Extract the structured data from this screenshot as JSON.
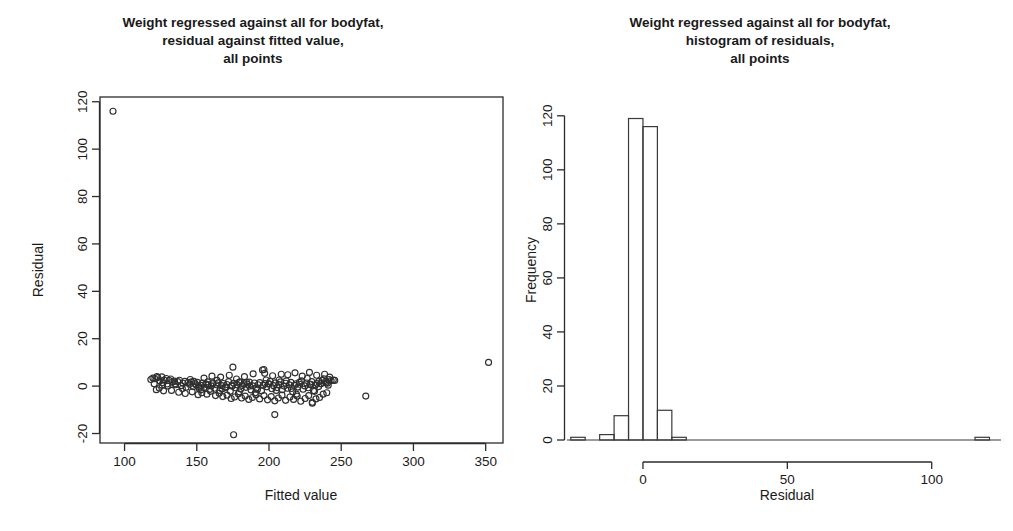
{
  "figure": {
    "background_color": "#ffffff",
    "foreground_color": "#1a1a1a",
    "panel_count": 2
  },
  "panels": [
    {
      "id": "residual-vs-fitted",
      "title_lines": [
        "Weight regressed against all for bodyfat,",
        "residual against fitted value,",
        "all points"
      ]
    },
    {
      "id": "histogram-of-residuals",
      "title_lines": [
        "Weight regressed against all for bodyfat,",
        "histogram of residuals,",
        "all points"
      ]
    }
  ],
  "chart_data": [
    {
      "type": "scatter",
      "id": "residual-vs-fitted",
      "title": "Weight regressed against all for bodyfat, residual against fitted value, all points",
      "xlabel": "Fitted value",
      "ylabel": "Residual",
      "xlim": [
        83,
        362
      ],
      "ylim": [
        -24,
        122
      ],
      "xticks": [
        100,
        150,
        200,
        250,
        300,
        350
      ],
      "yticks": [
        -20,
        0,
        20,
        40,
        60,
        80,
        100,
        120
      ],
      "xtick_labels": [
        "100",
        "150",
        "200",
        "250",
        "300",
        "350"
      ],
      "ytick_labels": [
        "-20",
        "0",
        "20",
        "40",
        "60",
        "80",
        "100",
        "120"
      ],
      "grid": false,
      "legend": false,
      "marker": "open-circle",
      "marker_size": 3,
      "n_points": 252,
      "points": [
        [
          92.0,
          116.0
        ],
        [
          118.2,
          2.8
        ],
        [
          119.6,
          3.4
        ],
        [
          121.0,
          3.1
        ],
        [
          122.4,
          4.0
        ],
        [
          123.0,
          3.6
        ],
        [
          124.5,
          2.2
        ],
        [
          125.8,
          3.9
        ],
        [
          126.6,
          1.4
        ],
        [
          127.4,
          2.6
        ],
        [
          128.9,
          3.2
        ],
        [
          124.0,
          -0.8
        ],
        [
          126.0,
          0.4
        ],
        [
          129.5,
          0.9
        ],
        [
          130.8,
          2.4
        ],
        [
          131.9,
          3.0
        ],
        [
          133.2,
          1.7
        ],
        [
          134.6,
          2.1
        ],
        [
          135.4,
          0.6
        ],
        [
          136.8,
          1.9
        ],
        [
          138.0,
          2.5
        ],
        [
          139.2,
          0.2
        ],
        [
          140.5,
          1.2
        ],
        [
          141.8,
          2.0
        ],
        [
          142.6,
          -0.5
        ],
        [
          143.9,
          1.5
        ],
        [
          145.0,
          0.8
        ],
        [
          146.3,
          1.8
        ],
        [
          147.5,
          -0.2
        ],
        [
          148.8,
          1.1
        ],
        [
          149.6,
          0.5
        ],
        [
          150.4,
          1.6
        ],
        [
          151.7,
          -1.0
        ],
        [
          152.9,
          0.3
        ],
        [
          154.0,
          1.3
        ],
        [
          155.2,
          -0.6
        ],
        [
          156.4,
          0.9
        ],
        [
          157.6,
          1.8
        ],
        [
          158.8,
          -1.4
        ],
        [
          160.0,
          0.1
        ],
        [
          161.2,
          1.0
        ],
        [
          162.4,
          -0.9
        ],
        [
          163.6,
          0.6
        ],
        [
          164.8,
          1.4
        ],
        [
          166.0,
          -1.8
        ],
        [
          167.2,
          0.2
        ],
        [
          168.4,
          1.1
        ],
        [
          169.6,
          -0.4
        ],
        [
          170.8,
          0.7
        ],
        [
          172.0,
          1.9
        ],
        [
          173.2,
          -2.2
        ],
        [
          174.4,
          0.0
        ],
        [
          175.6,
          1.2
        ],
        [
          176.8,
          -0.7
        ],
        [
          178.0,
          0.5
        ],
        [
          179.2,
          1.6
        ],
        [
          180.4,
          -1.2
        ],
        [
          181.6,
          0.3
        ],
        [
          182.8,
          1.0
        ],
        [
          184.0,
          -0.5
        ],
        [
          185.2,
          0.8
        ],
        [
          186.4,
          1.7
        ],
        [
          187.6,
          -1.6
        ],
        [
          188.8,
          0.1
        ],
        [
          190.0,
          1.3
        ],
        [
          191.2,
          -0.8
        ],
        [
          192.4,
          0.6
        ],
        [
          193.6,
          1.5
        ],
        [
          194.8,
          -2.0
        ],
        [
          196.0,
          0.4
        ],
        [
          197.2,
          1.1
        ],
        [
          198.4,
          -0.3
        ],
        [
          199.6,
          0.9
        ],
        [
          200.8,
          2.0
        ],
        [
          202.0,
          -1.1
        ],
        [
          203.2,
          0.2
        ],
        [
          204.4,
          1.4
        ],
        [
          205.6,
          -0.6
        ],
        [
          206.8,
          0.7
        ],
        [
          208.0,
          1.8
        ],
        [
          209.2,
          -1.5
        ],
        [
          210.4,
          0.0
        ],
        [
          211.6,
          1.2
        ],
        [
          212.8,
          -0.9
        ],
        [
          214.0,
          0.5
        ],
        [
          215.2,
          1.6
        ],
        [
          216.4,
          -2.4
        ],
        [
          217.6,
          0.3
        ],
        [
          218.8,
          1.0
        ],
        [
          220.0,
          -0.4
        ],
        [
          221.2,
          0.8
        ],
        [
          222.4,
          2.2
        ],
        [
          223.6,
          -1.3
        ],
        [
          224.8,
          0.1
        ],
        [
          226.0,
          1.3
        ],
        [
          227.2,
          -0.7
        ],
        [
          228.4,
          0.6
        ],
        [
          229.6,
          1.9
        ],
        [
          230.8,
          -1.9
        ],
        [
          232.0,
          0.4
        ],
        [
          233.2,
          1.1
        ],
        [
          234.4,
          -0.2
        ],
        [
          235.6,
          1.0
        ],
        [
          236.8,
          2.4
        ],
        [
          238.0,
          3.1
        ],
        [
          239.2,
          2.0
        ],
        [
          240.4,
          1.2
        ],
        [
          241.6,
          2.8
        ],
        [
          243.0,
          2.3
        ],
        [
          244.5,
          2.6
        ],
        [
          120.5,
          1.0
        ],
        [
          122.0,
          -1.5
        ],
        [
          127.0,
          -2.0
        ],
        [
          132.5,
          -1.8
        ],
        [
          137.5,
          -2.6
        ],
        [
          142.0,
          -3.1
        ],
        [
          146.8,
          -2.4
        ],
        [
          150.9,
          -3.6
        ],
        [
          153.5,
          -2.8
        ],
        [
          157.0,
          -3.4
        ],
        [
          159.5,
          -2.2
        ],
        [
          163.0,
          -4.0
        ],
        [
          165.5,
          -3.0
        ],
        [
          168.0,
          -4.4
        ],
        [
          171.0,
          -3.8
        ],
        [
          173.8,
          -5.2
        ],
        [
          176.2,
          -4.6
        ],
        [
          178.8,
          -3.2
        ],
        [
          181.0,
          -5.0
        ],
        [
          183.5,
          -4.2
        ],
        [
          186.0,
          -5.6
        ],
        [
          188.5,
          -4.8
        ],
        [
          191.0,
          -3.6
        ],
        [
          193.5,
          -5.4
        ],
        [
          196.5,
          -4.0
        ],
        [
          199.0,
          -5.8
        ],
        [
          201.5,
          -4.4
        ],
        [
          204.0,
          -6.2
        ],
        [
          206.5,
          -5.0
        ],
        [
          209.0,
          -3.8
        ],
        [
          211.5,
          -6.0
        ],
        [
          214.5,
          -4.6
        ],
        [
          217.0,
          -5.6
        ],
        [
          219.5,
          -4.2
        ],
        [
          222.0,
          -6.4
        ],
        [
          225.0,
          -5.2
        ],
        [
          227.5,
          -4.0
        ],
        [
          230.0,
          -6.8
        ],
        [
          232.5,
          -5.4
        ],
        [
          235.0,
          -4.8
        ],
        [
          237.5,
          -3.4
        ],
        [
          240.0,
          -2.8
        ],
        [
          155.0,
          3.4
        ],
        [
          160.5,
          4.2
        ],
        [
          166.5,
          3.8
        ],
        [
          172.5,
          4.6
        ],
        [
          177.5,
          3.0
        ],
        [
          183.0,
          4.0
        ],
        [
          189.0,
          5.2
        ],
        [
          195.5,
          6.8
        ],
        [
          197.0,
          5.4
        ],
        [
          202.5,
          4.4
        ],
        [
          208.5,
          5.0
        ],
        [
          213.0,
          4.8
        ],
        [
          218.0,
          5.6
        ],
        [
          223.0,
          4.2
        ],
        [
          228.0,
          5.8
        ],
        [
          233.0,
          4.6
        ],
        [
          238.5,
          5.0
        ],
        [
          242.0,
          3.8
        ],
        [
          145.5,
          2.8
        ],
        [
          151.5,
          -0.2
        ],
        [
          156.5,
          0.8
        ],
        [
          161.0,
          1.4
        ],
        [
          167.5,
          -1.2
        ],
        [
          174.5,
          0.4
        ],
        [
          179.5,
          -2.4
        ],
        [
          184.5,
          1.6
        ],
        [
          190.5,
          -2.8
        ],
        [
          198.0,
          2.6
        ],
        [
          205.0,
          -1.8
        ],
        [
          212.0,
          2.2
        ],
        [
          219.0,
          -3.4
        ],
        [
          226.5,
          3.2
        ],
        [
          231.5,
          -2.2
        ],
        [
          236.0,
          1.0
        ],
        [
          241.0,
          0.4
        ],
        [
          175.0,
          8.0
        ],
        [
          196.5,
          7.0
        ],
        [
          230.0,
          -7.2
        ],
        [
          204.0,
          -12.0
        ],
        [
          175.5,
          -20.5
        ],
        [
          267.0,
          -4.2
        ],
        [
          352.0,
          10.0
        ],
        [
          130.0,
          0.0
        ],
        [
          135.0,
          1.0
        ],
        [
          140.0,
          -1.0
        ],
        [
          148.0,
          2.0
        ],
        [
          153.0,
          -1.5
        ],
        [
          158.0,
          0.5
        ],
        [
          164.0,
          2.4
        ],
        [
          170.0,
          -0.6
        ],
        [
          180.0,
          1.8
        ],
        [
          186.5,
          0.0
        ],
        [
          192.0,
          -1.4
        ],
        [
          200.0,
          1.0
        ],
        [
          207.0,
          2.6
        ],
        [
          215.5,
          -1.0
        ],
        [
          221.0,
          1.6
        ],
        [
          229.0,
          0.8
        ],
        [
          234.5,
          2.0
        ],
        [
          239.5,
          1.4
        ],
        [
          245.5,
          2.4
        ]
      ]
    },
    {
      "type": "bar",
      "subtype": "histogram",
      "id": "histogram-of-residuals",
      "title": "Weight regressed against all for bodyfat, histogram of residuals, all points",
      "xlabel": "Residual",
      "ylabel": "Frequency",
      "xlim": [
        -27,
        124
      ],
      "ylim": [
        0,
        124
      ],
      "xticks": [
        0,
        50,
        100
      ],
      "xtick_labels": [
        "0",
        "50",
        "100"
      ],
      "yticks": [
        0,
        20,
        40,
        60,
        80,
        100,
        120
      ],
      "ytick_labels": [
        "0",
        "20",
        "40",
        "60",
        "80",
        "100",
        "120"
      ],
      "grid": false,
      "legend": false,
      "bin_width": 5,
      "bin_edges": [
        -25,
        -20,
        -15,
        -10,
        -5,
        0,
        5,
        10,
        15,
        115,
        120
      ],
      "bins": [
        {
          "left": -25,
          "right": -20,
          "frequency": 1
        },
        {
          "left": -20,
          "right": -15,
          "frequency": 0
        },
        {
          "left": -15,
          "right": -10,
          "frequency": 2
        },
        {
          "left": -10,
          "right": -5,
          "frequency": 9
        },
        {
          "left": -5,
          "right": 0,
          "frequency": 119
        },
        {
          "left": 0,
          "right": 5,
          "frequency": 116
        },
        {
          "left": 5,
          "right": 10,
          "frequency": 11
        },
        {
          "left": 10,
          "right": 15,
          "frequency": 1
        },
        {
          "left": 115,
          "right": 120,
          "frequency": 1
        }
      ],
      "categories": [
        "-25",
        "-20",
        "-15",
        "-10",
        "-5",
        "0",
        "5",
        "10",
        "115"
      ],
      "values": [
        1,
        0,
        2,
        9,
        119,
        116,
        11,
        1,
        1
      ]
    }
  ]
}
